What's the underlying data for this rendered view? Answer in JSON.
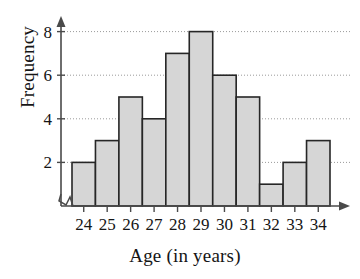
{
  "chart_data": {
    "type": "bar",
    "title": "",
    "xlabel": "Age (in years)",
    "ylabel": "Frequency",
    "categories": [
      "24",
      "25",
      "26",
      "27",
      "28",
      "29",
      "30",
      "31",
      "32",
      "33",
      "34"
    ],
    "values": [
      2,
      3,
      5,
      4,
      7,
      8,
      6,
      5,
      1,
      2,
      3
    ],
    "ylim": [
      0,
      9
    ],
    "ytick_labels": [
      "2",
      "4",
      "6",
      "8"
    ],
    "ytick_values": [
      2,
      4,
      6,
      8
    ],
    "xtick_labels": [
      "24",
      "25",
      "26",
      "27",
      "28",
      "29",
      "30",
      "31",
      "32",
      "33",
      "34"
    ],
    "grid": true,
    "grid_axis": "y",
    "grid_style": "dotted",
    "legend": "none",
    "bar_fill_color": "#d6d6d6",
    "bar_edge_color": "#262626",
    "axis_color": "#4a4a4a",
    "grid_color": "#9a9a9a",
    "axis_break": true,
    "y_axis_arrow": true,
    "x_axis_arrow": true
  },
  "axes": {
    "y_title": "Frequency",
    "x_title": "Age (in years)"
  }
}
